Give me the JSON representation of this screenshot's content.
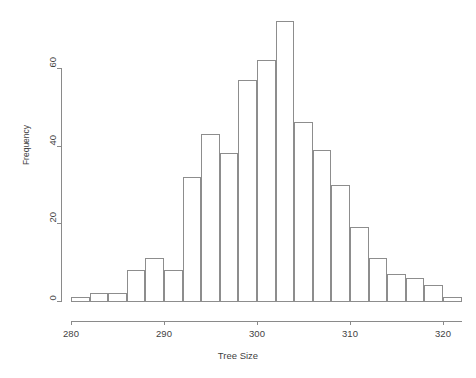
{
  "chart_data": {
    "type": "bar",
    "title": "",
    "subtitle": "",
    "xlabel": "Tree Size",
    "ylabel": "Frequency",
    "xlim": [
      280,
      322
    ],
    "ylim": [
      0,
      72
    ],
    "grid": false,
    "legend": false,
    "bin_width": 2,
    "x_ticks": [
      280,
      290,
      300,
      310,
      320
    ],
    "x_tick_labels": [
      "280",
      "290",
      "300",
      "310",
      "320"
    ],
    "y_ticks": [
      0,
      20,
      40,
      60
    ],
    "y_tick_labels": [
      "0",
      "20",
      "40",
      "60"
    ],
    "bin_edges": [
      280,
      282,
      284,
      286,
      288,
      290,
      292,
      294,
      296,
      298,
      300,
      302,
      304,
      306,
      308,
      310,
      312,
      314,
      316,
      318,
      320,
      322
    ],
    "categories": [
      "280-282",
      "282-284",
      "284-286",
      "286-288",
      "288-290",
      "290-292",
      "292-294",
      "294-296",
      "296-298",
      "298-300",
      "300-302",
      "302-304",
      "304-306",
      "306-308",
      "308-310",
      "310-312",
      "312-314",
      "314-316",
      "316-318",
      "318-320",
      "320-322"
    ],
    "values": [
      1,
      2,
      2,
      8,
      11,
      8,
      32,
      43,
      38,
      57,
      62,
      72,
      46,
      39,
      30,
      19,
      11,
      7,
      6,
      4,
      1
    ],
    "colors": {
      "bar_stroke": "#8d8d8d",
      "bar_fill": "transparent",
      "axis": "#8a8a8a",
      "text": "#3f3f3f",
      "background": "#ffffff"
    }
  },
  "axes": {
    "x_title": "Tree Size",
    "y_title": "Frequency"
  }
}
